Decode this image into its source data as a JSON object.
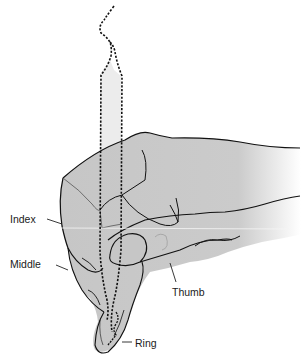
{
  "figure": {
    "colors": {
      "skin": "#c9c9c9",
      "outline": "#111111",
      "pencil_fill": "#e8e8e8",
      "background": "#ffffff"
    }
  },
  "labels": [
    {
      "id": "index",
      "text": "Index"
    },
    {
      "id": "middle",
      "text": "Middle"
    },
    {
      "id": "thumb",
      "text": "Thumb"
    },
    {
      "id": "ring",
      "text": "Ring"
    }
  ]
}
